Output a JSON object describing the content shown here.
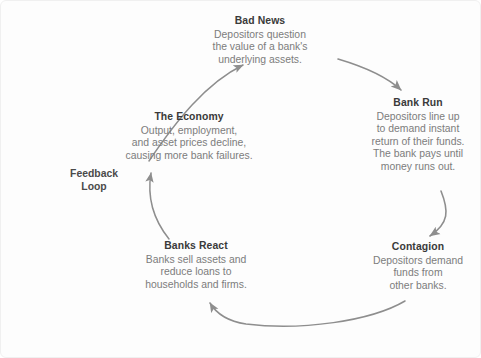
{
  "diagram": {
    "feedback_label": "Feedback\nLoop",
    "feedback_label_line1": "Feedback",
    "feedback_label_line2": "Loop",
    "colors": {
      "background": "#fdfdfd",
      "heading_text": "#3a3a3a",
      "body_text": "#7c7c7c",
      "arrow": "#8c8c8c",
      "border": "#f0f0f0"
    },
    "nodes": [
      {
        "id": "bad-news",
        "title": "Bad News",
        "body": "Depositors question the value of a bank's underlying assets.",
        "lines": [
          "Depositors question",
          "the value of a bank's",
          "underlying assets."
        ]
      },
      {
        "id": "bank-run",
        "title": "Bank Run",
        "body": "Depositors line up to demand instant return of their funds. The bank pays until money runs out.",
        "lines": [
          "Depositors line up",
          "to demand instant",
          "return of their funds.",
          "The bank pays until",
          "money runs out."
        ]
      },
      {
        "id": "contagion",
        "title": "Contagion",
        "body": "Depositors demand funds from other banks.",
        "lines": [
          "Depositors demand",
          "funds from",
          "other banks."
        ]
      },
      {
        "id": "banks-react",
        "title": "Banks React",
        "body": "Banks sell assets and reduce loans to households and firms.",
        "lines": [
          "Banks sell assets and",
          "reduce loans to",
          "households and firms."
        ]
      },
      {
        "id": "economy",
        "title": "The Economy",
        "body": "Output, employment, and asset prices decline, causing more bank failures.",
        "lines": [
          "Output, employment,",
          "and asset prices decline,",
          "causing more bank failures."
        ]
      }
    ],
    "arrows": [
      {
        "id": "bad-news-to-bank-run",
        "from": "bad-news",
        "to": "bank-run"
      },
      {
        "id": "bank-run-to-contagion",
        "from": "bank-run",
        "to": "contagion"
      },
      {
        "id": "contagion-to-banks-react",
        "from": "contagion",
        "to": "banks-react"
      },
      {
        "id": "banks-react-to-economy",
        "from": "banks-react",
        "to": "economy"
      },
      {
        "id": "economy-to-bad-news",
        "from": "economy",
        "to": "bad-news"
      }
    ]
  }
}
